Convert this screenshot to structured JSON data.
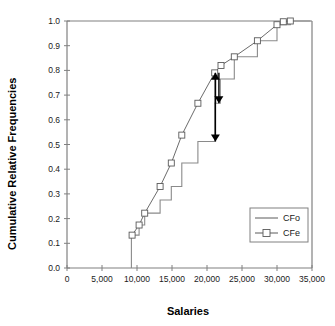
{
  "chart_data": {
    "type": "line",
    "title": "",
    "xlabel": "Salaries",
    "ylabel": "Cumulative Relative Frequencies",
    "xlim": [
      0,
      35000
    ],
    "ylim": [
      0,
      1.0
    ],
    "grid": false,
    "legend_position": "lower-right",
    "x_ticks": [
      0,
      5000,
      10000,
      15000,
      20000,
      25000,
      30000,
      35000
    ],
    "x_tick_labels": [
      "0",
      "5,000",
      "10,000",
      "15,000",
      "20,000",
      "25,000",
      "30,000",
      "35,000"
    ],
    "y_ticks": [
      0.0,
      0.1,
      0.2,
      0.3,
      0.4,
      0.5,
      0.6,
      0.7,
      0.8,
      0.9,
      1.0
    ],
    "y_tick_labels": [
      "0.0",
      "0.1",
      "0.2",
      "0.3",
      "0.4",
      "0.5",
      "0.6",
      "0.7",
      "0.8",
      "0.9",
      "1.0"
    ],
    "series": [
      {
        "name": "CFo",
        "style": "step",
        "marker": "none",
        "color": "#8a8a8a",
        "points": [
          [
            9200,
            0.0
          ],
          [
            9200,
            0.133
          ],
          [
            10300,
            0.133
          ],
          [
            10300,
            0.174
          ],
          [
            11100,
            0.174
          ],
          [
            11100,
            0.222
          ],
          [
            13300,
            0.222
          ],
          [
            13300,
            0.275
          ],
          [
            14900,
            0.275
          ],
          [
            14900,
            0.33
          ],
          [
            16400,
            0.33
          ],
          [
            16400,
            0.425
          ],
          [
            18700,
            0.425
          ],
          [
            18700,
            0.512
          ],
          [
            21100,
            0.512
          ],
          [
            21100,
            0.667
          ],
          [
            21900,
            0.667
          ],
          [
            21900,
            0.765
          ],
          [
            23900,
            0.765
          ],
          [
            23900,
            0.855
          ],
          [
            27200,
            0.855
          ],
          [
            27200,
            0.92
          ],
          [
            30000,
            0.92
          ],
          [
            30000,
            0.985
          ],
          [
            31900,
            0.985
          ],
          [
            31900,
            1.0
          ],
          [
            34800,
            1.0
          ]
        ]
      },
      {
        "name": "CFe",
        "style": "line",
        "marker": "square",
        "color": "#5a5a5a",
        "points": [
          [
            9300,
            0.133
          ],
          [
            10300,
            0.174
          ],
          [
            11100,
            0.222
          ],
          [
            13300,
            0.33
          ],
          [
            14900,
            0.425
          ],
          [
            16400,
            0.538
          ],
          [
            18700,
            0.667
          ],
          [
            21100,
            0.79
          ],
          [
            22000,
            0.82
          ],
          [
            23900,
            0.855
          ],
          [
            27200,
            0.92
          ],
          [
            30000,
            0.985
          ],
          [
            30900,
            0.997
          ],
          [
            31900,
            1.0
          ]
        ]
      }
    ],
    "annotations": [
      {
        "name": "deviation-arrow-upper",
        "type": "arrow",
        "x": 21200,
        "y_from": 0.667,
        "y_to": 0.79,
        "head": "up"
      },
      {
        "name": "deviation-arrow-middle",
        "type": "arrow",
        "x": 21700,
        "y_from": 0.79,
        "y_to": 0.667,
        "head": "down"
      },
      {
        "name": "deviation-arrow-lower",
        "type": "arrow",
        "x": 21200,
        "y_from": 0.79,
        "y_to": 0.512,
        "head": "down"
      }
    ]
  },
  "legend": {
    "entries": [
      {
        "label": "CFo"
      },
      {
        "label": "CFe"
      }
    ]
  },
  "axes": {
    "x_title": "Salaries",
    "y_title": "Cumulative Relative Frequencies"
  }
}
